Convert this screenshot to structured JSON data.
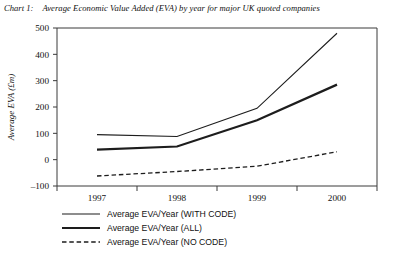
{
  "caption": {
    "label": "Chart 1:",
    "text": "Average Economic Value Added (EVA) by year for major UK quoted companies"
  },
  "chart_data": {
    "type": "line",
    "title": "Average Economic Value Added (EVA) by year for major UK quoted companies",
    "xlabel": "",
    "ylabel": "Average EVA (£m)",
    "categories": [
      "1997",
      "1998",
      "1999",
      "2000"
    ],
    "ylim": [
      -100,
      500
    ],
    "yticks": [
      -100,
      0,
      100,
      200,
      300,
      400,
      500
    ],
    "ytick_labels": [
      "–100",
      "0",
      "100",
      "200",
      "300",
      "400",
      "500"
    ],
    "grid": false,
    "legend_position": "below-left",
    "series": [
      {
        "name": "Average EVA/Year (WITH CODE)",
        "style": "solid",
        "width": 1.1,
        "color": "#1d1d1d",
        "values": [
          95,
          88,
          195,
          480
        ]
      },
      {
        "name": "Average EVA/Year (ALL)",
        "style": "solid",
        "width": 2.2,
        "color": "#1d1d1d",
        "values": [
          38,
          50,
          150,
          285
        ]
      },
      {
        "name": "Average EVA/Year (NO CODE)",
        "style": "dashed",
        "width": 1.3,
        "color": "#1d1d1d",
        "values": [
          -62,
          -45,
          -25,
          30
        ]
      }
    ]
  },
  "legend": {
    "items": [
      {
        "label": "Average EVA/Year (WITH CODE)",
        "style": "solid",
        "width": 1.1
      },
      {
        "label": "Average EVA/Year (ALL)",
        "style": "solid",
        "width": 2.2
      },
      {
        "label": "Average EVA/Year (NO CODE)",
        "style": "dashed",
        "width": 1.3
      }
    ]
  }
}
